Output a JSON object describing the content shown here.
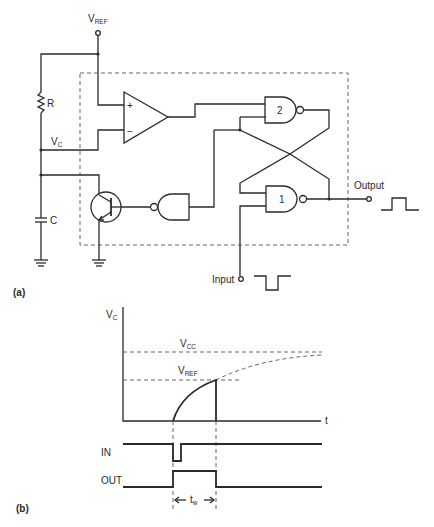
{
  "figure_a": {
    "label": "(a)",
    "vref": {
      "main": "V",
      "sub": "REF"
    },
    "resistor": "R",
    "capacitor": "C",
    "vc": {
      "main": "V",
      "sub": "C"
    },
    "opamp_plus": "+",
    "opamp_minus": "−",
    "gate_2": "2",
    "gate_1": "1",
    "output_label": "Output",
    "input_label": "Input"
  },
  "figure_b": {
    "label": "(b)",
    "y_axis": {
      "main": "V",
      "sub": "C"
    },
    "x_axis": "t",
    "vcc": {
      "main": "V",
      "sub": "CC"
    },
    "vref": {
      "main": "V",
      "sub": "REF"
    },
    "in_label": "IN",
    "out_label": "OUT",
    "tw": {
      "main": "t",
      "sub": "w"
    }
  }
}
